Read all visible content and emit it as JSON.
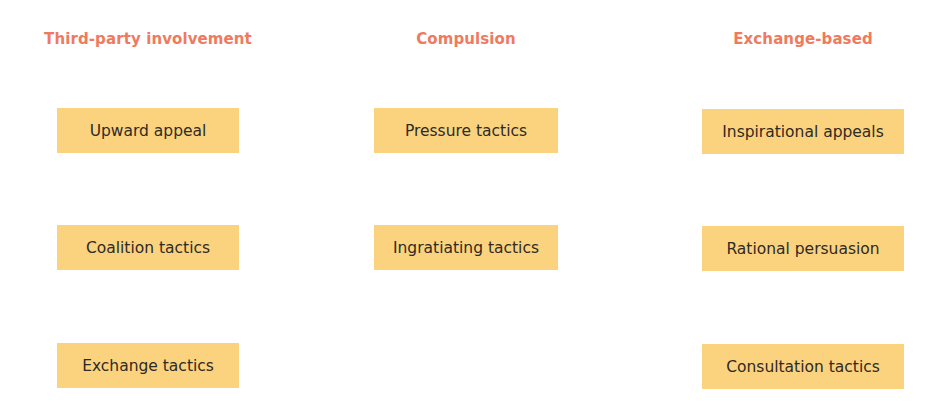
{
  "columns": [
    {
      "header": "Third-party involvement",
      "items": [
        "Upward appeal",
        "Coalition tactics",
        "Exchange tactics"
      ]
    },
    {
      "header": "Compulsion",
      "items": [
        "Pressure tactics",
        "Ingratiating tactics"
      ]
    },
    {
      "header": "Exchange-based",
      "items": [
        "Inspirational appeals",
        "Rational persuasion",
        "Consultation tactics"
      ]
    }
  ],
  "colors": {
    "header_text": "#ef7a5e",
    "box_fill": "#fbd37e",
    "box_text": "#2e2a24",
    "background": "#ffffff"
  }
}
